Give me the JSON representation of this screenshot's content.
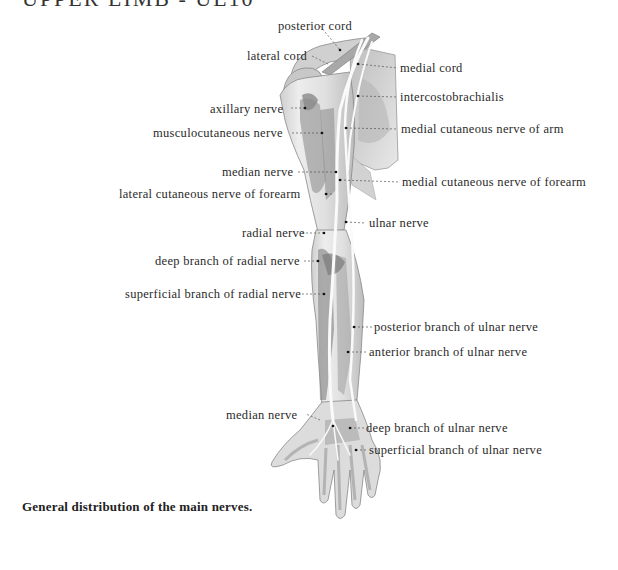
{
  "header": {
    "title": "UPPER LIMB - UL10"
  },
  "figure": {
    "caption": "General distribution of the main nerves.",
    "labels_left": [
      {
        "text": "lateral cord",
        "x": 247,
        "y": 49
      },
      {
        "text": "axillary nerve",
        "x": 210,
        "y": 102
      },
      {
        "text": "musculocutaneous nerve",
        "x": 153,
        "y": 126
      },
      {
        "text": "median nerve",
        "x": 222,
        "y": 165
      },
      {
        "text": "lateral cutaneous nerve of forearm",
        "x": 119,
        "y": 187
      },
      {
        "text": "radial nerve",
        "x": 242,
        "y": 226
      },
      {
        "text": "deep branch of radial nerve",
        "x": 155,
        "y": 254
      },
      {
        "text": "superficial branch of radial nerve",
        "x": 125,
        "y": 287
      },
      {
        "text": "median nerve",
        "x": 226,
        "y": 408
      }
    ],
    "labels_top": [
      {
        "text": "posterior cord",
        "x": 278,
        "y": 19
      }
    ],
    "labels_right": [
      {
        "text": "medial cord",
        "x": 400,
        "y": 61
      },
      {
        "text": "intercostobrachialis",
        "x": 400,
        "y": 90
      },
      {
        "text": "medial cutaneous nerve of arm",
        "x": 401,
        "y": 122
      },
      {
        "text": "medial cutaneous nerve of forearm",
        "x": 402,
        "y": 175
      },
      {
        "text": "ulnar nerve",
        "x": 369,
        "y": 216
      },
      {
        "text": "posterior branch of ulnar nerve",
        "x": 374,
        "y": 320
      },
      {
        "text": "anterior branch of ulnar nerve",
        "x": 369,
        "y": 345
      },
      {
        "text": "deep branch of ulnar nerve",
        "x": 366,
        "y": 421
      },
      {
        "text": "superficial branch of ulnar nerve",
        "x": 369,
        "y": 443
      }
    ],
    "colors": {
      "skin": "#e4e4e4",
      "muscle": "#9a9a9a",
      "nerve": "#fafafa",
      "outline": "#777777",
      "leader": "#555555"
    }
  }
}
